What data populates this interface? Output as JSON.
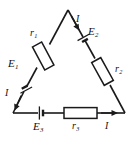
{
  "figure": {
    "kind": "circuit-diagram",
    "colors": {
      "background": "#ffffff",
      "wire": "#1a1a1a",
      "component_fill": "#ffffff",
      "label": "#111111"
    },
    "geometry": {
      "apex": [
        68,
        10
      ],
      "bottom_left": [
        13,
        113
      ],
      "bottom_right": [
        125,
        113
      ]
    }
  },
  "labels": {
    "r1": {
      "symbol": "r",
      "subscript": "1"
    },
    "r2": {
      "symbol": "r",
      "subscript": "2"
    },
    "r3": {
      "symbol": "r",
      "subscript": "3"
    },
    "e1": {
      "symbol": "E",
      "subscript": "1"
    },
    "e2": {
      "symbol": "E",
      "subscript": "2"
    },
    "e3": {
      "symbol": "E",
      "subscript": "3"
    },
    "current_left": "I",
    "current_top": "I",
    "current_bottom": "I"
  },
  "branches": [
    {
      "name": "left-branch",
      "from": "apex",
      "to": "bottom-left",
      "resistor": "r1",
      "source": "E1",
      "current_arrow": "down-left"
    },
    {
      "name": "right-branch",
      "from": "apex",
      "to": "bottom-right",
      "resistor": "r2",
      "source": "E2",
      "current_arrow": "down-right"
    },
    {
      "name": "bottom-branch",
      "from": "bottom-left",
      "to": "bottom-right",
      "resistor": "r3",
      "source": "E3",
      "current_arrow": "right"
    }
  ]
}
